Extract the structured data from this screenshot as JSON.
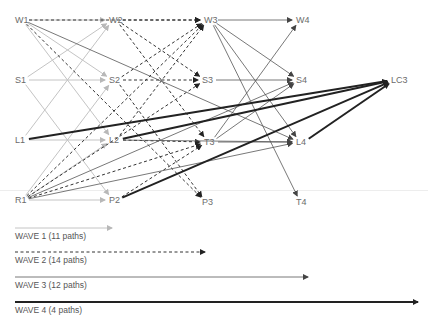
{
  "nodes": {
    "W1": {
      "label": "W1",
      "x": 15,
      "y": 15
    },
    "W2": {
      "label": "W2",
      "x": 109,
      "y": 15
    },
    "W3": {
      "label": "W3",
      "x": 204,
      "y": 15
    },
    "W4": {
      "label": "W4",
      "x": 296,
      "y": 15
    },
    "S1": {
      "label": "S1",
      "x": 15,
      "y": 75
    },
    "S2": {
      "label": "S2",
      "x": 109,
      "y": 75
    },
    "S3": {
      "label": "S3",
      "x": 202,
      "y": 75
    },
    "S4": {
      "label": "S4",
      "x": 296,
      "y": 75
    },
    "L1": {
      "label": "L1",
      "x": 15,
      "y": 135
    },
    "L2": {
      "label": "L2",
      "x": 109,
      "y": 135
    },
    "T3": {
      "label": "T3",
      "x": 204,
      "y": 137
    },
    "L4": {
      "label": "L4",
      "x": 296,
      "y": 137
    },
    "R1": {
      "label": "R1",
      "x": 15,
      "y": 195
    },
    "P2": {
      "label": "P2",
      "x": 109,
      "y": 195
    },
    "P3": {
      "label": "P3",
      "x": 202,
      "y": 197
    },
    "T4": {
      "label": "T4",
      "x": 296,
      "y": 197
    },
    "LC3": {
      "label": "LC3",
      "x": 391,
      "y": 75
    }
  },
  "waves": [
    {
      "id": "wave1",
      "label": "WAVE 1 (11 paths)",
      "style": "thin-light",
      "color": "#b8b8b8",
      "legend_y": 228,
      "legend_x2": 112
    },
    {
      "id": "wave2",
      "label": "WAVE 2 (14 paths)",
      "style": "dashed",
      "color": "#333333",
      "legend_y": 252,
      "legend_x2": 205
    },
    {
      "id": "wave3",
      "label": "WAVE 3 (12 paths)",
      "style": "thin-dark",
      "color": "#555555",
      "legend_y": 277,
      "legend_x2": 308
    },
    {
      "id": "wave4",
      "label": "WAVE 4 (4 paths)",
      "style": "thick",
      "color": "#222222",
      "legend_y": 302,
      "legend_x2": 418
    }
  ],
  "edges": {
    "wave1": [
      [
        "W1",
        "W2"
      ],
      [
        "W1",
        "S2"
      ],
      [
        "W1",
        "L2"
      ],
      [
        "S1",
        "S2"
      ],
      [
        "S1",
        "W2"
      ],
      [
        "S1",
        "P2"
      ],
      [
        "L1",
        "L2"
      ],
      [
        "L1",
        "W2"
      ],
      [
        "R1",
        "P2"
      ],
      [
        "R1",
        "S2"
      ],
      [
        "R1",
        "L2"
      ]
    ],
    "wave2": [
      [
        "W1",
        "W3"
      ],
      [
        "W1",
        "P3"
      ],
      [
        "W2",
        "W3"
      ],
      [
        "W2",
        "S3"
      ],
      [
        "W2",
        "T3"
      ],
      [
        "S2",
        "S3"
      ],
      [
        "S2",
        "W3"
      ],
      [
        "S2",
        "P3"
      ],
      [
        "L2",
        "T3"
      ],
      [
        "L2",
        "W3"
      ],
      [
        "R1",
        "W3"
      ],
      [
        "R1",
        "S3"
      ],
      [
        "R1",
        "T3"
      ],
      [
        "P2",
        "T3"
      ]
    ],
    "wave3": [
      [
        "W3",
        "W4"
      ],
      [
        "W3",
        "S4"
      ],
      [
        "W3",
        "L4"
      ],
      [
        "W3",
        "T4"
      ],
      [
        "S3",
        "S4"
      ],
      [
        "T3",
        "L4"
      ],
      [
        "T3",
        "W4"
      ],
      [
        "T3",
        "S4"
      ],
      [
        "W1",
        "L4"
      ],
      [
        "R1",
        "L4"
      ],
      [
        "R1",
        "S4"
      ],
      [
        "L2",
        "L4"
      ]
    ],
    "wave4": [
      [
        "L1",
        "LC3"
      ],
      [
        "L2",
        "LC3"
      ],
      [
        "P2",
        "LC3"
      ],
      [
        "L4",
        "LC3"
      ]
    ]
  }
}
